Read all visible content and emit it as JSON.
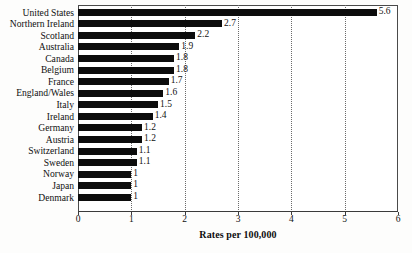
{
  "chart_data": {
    "type": "bar",
    "orientation": "horizontal",
    "title": "",
    "xlabel": "Rates per 100,000",
    "ylabel": "",
    "xlim": [
      0,
      6
    ],
    "xticks": [
      "0",
      "1",
      "2",
      "3",
      "4",
      "5",
      "6"
    ],
    "grid": "vertical-dotted",
    "legend": "none",
    "bar_color": "#0c0c0c",
    "categories": [
      "United States",
      "Northern Ireland",
      "Scotland",
      "Australia",
      "Canada",
      "Belgium",
      "France",
      "England/Wales",
      "Italy",
      "Ireland",
      "Germany",
      "Austria",
      "Switzerland",
      "Sweden",
      "Norway",
      "Japan",
      "Denmark"
    ],
    "values": [
      5.6,
      2.7,
      2.2,
      1.9,
      1.8,
      1.8,
      1.7,
      1.6,
      1.5,
      1.4,
      1.2,
      1.2,
      1.1,
      1.1,
      1,
      1,
      1
    ],
    "value_labels": [
      "5.6",
      "2.7",
      "2.2",
      "1.9",
      "1.8",
      "1.8",
      "1.7",
      "1.6",
      "1.5",
      "1.4",
      "1.2",
      "1.2",
      "1.1",
      "1.1",
      "1",
      "1",
      "1"
    ]
  }
}
